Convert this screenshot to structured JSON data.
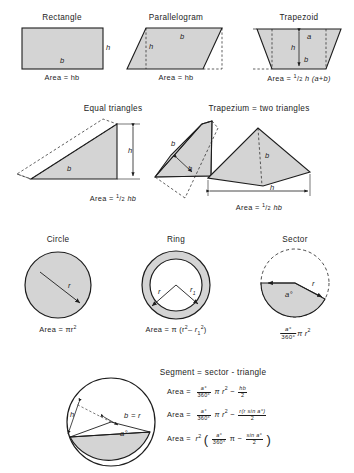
{
  "diagram": {
    "paper_color": "#ffffff",
    "ink_color": "#1d1d1d",
    "fill_color": "#d4d4d4",
    "sections": [
      {
        "id": "rectangle",
        "title": "Rectangle",
        "formula": "Area = hb",
        "labels": [
          "h",
          "b"
        ]
      },
      {
        "id": "parallelogram",
        "title": "Parallelogram",
        "formula": "Area = hb",
        "labels": [
          "h",
          "b"
        ]
      },
      {
        "id": "trapezoid",
        "title": "Trapezoid",
        "formula_prefix": "Area = ",
        "formula_half_num": "1",
        "formula_half_den": "2",
        "formula_suffix": "h (a+b)",
        "labels": [
          "a",
          "h",
          "b"
        ]
      },
      {
        "id": "equal-triangles",
        "title": "Equal triangles",
        "formula_prefix": "Area = ",
        "formula_half_num": "1",
        "formula_half_den": "2",
        "formula_suffix": "hb",
        "labels": [
          "h",
          "b",
          "h",
          "b"
        ]
      },
      {
        "id": "trapezium",
        "title": "Trapezium = two triangles",
        "formula_prefix": "Area = ",
        "formula_half_num": "1",
        "formula_half_den": "2",
        "formula_suffix": "hb",
        "labels": [
          "b",
          "h"
        ]
      },
      {
        "id": "circle",
        "title": "Circle",
        "formula": "Area = πr",
        "formula_exp": "2",
        "labels": [
          "r"
        ]
      },
      {
        "id": "ring",
        "title": "Ring",
        "formula": "Area = π (r",
        "formula_exp": "2",
        "labels": [
          "r",
          "r1"
        ]
      },
      {
        "id": "sector",
        "title": "Sector",
        "labels": [
          "r",
          "a°"
        ],
        "formula_num": "a°",
        "formula_den": "360°",
        "formula_tail": "π r",
        "formula_exp": "2"
      },
      {
        "id": "segment",
        "title": "Segment = sector - triangle",
        "labels": [
          "h",
          "b = r",
          "a°"
        ]
      }
    ],
    "segment_formulas": [
      {
        "lead": "Area =",
        "f1_num": "a°",
        "f1_den": "360°",
        "mid": "π r",
        "exp": "2",
        "minus": "−",
        "f2_num": "hb",
        "f2_den": "2"
      },
      {
        "lead": "Area =",
        "f1_num": "a°",
        "f1_den": "360°",
        "mid": "π r",
        "exp": "2",
        "minus": "−",
        "f2_num": "r(r sin a°)",
        "f2_den": "2"
      },
      {
        "lead": "Area =",
        "r_sym": "r",
        "exp": "2",
        "open": "(",
        "f1_num": "a°",
        "f1_den": "360°",
        "mid": "π",
        "minus": "−",
        "f2_num": "sin a°",
        "f2_den": "2",
        "close": ")"
      }
    ]
  }
}
